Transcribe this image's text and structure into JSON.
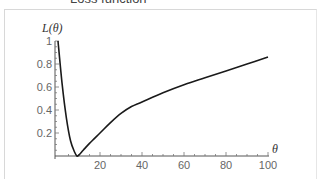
{
  "chart_data": {
    "type": "line",
    "title": "Loss function",
    "xlabel": "θ",
    "ylabel": "L(θ)",
    "xlim": [
      0,
      100
    ],
    "ylim": [
      0,
      1
    ],
    "x_ticks": [
      20,
      40,
      60,
      80,
      100
    ],
    "y_ticks": [
      0.2,
      0.4,
      0.6,
      0.8,
      1
    ],
    "grid": false,
    "legend": null,
    "series": [
      {
        "name": "L(θ)",
        "color": "#1a1a1a",
        "x": [
          0,
          2,
          4,
          6,
          8,
          9,
          10,
          12,
          15,
          20,
          25,
          30,
          35,
          40,
          50,
          60,
          70,
          80,
          90,
          100
        ],
        "y": [
          1.0,
          0.62,
          0.33,
          0.13,
          0.03,
          0.0,
          0.01,
          0.05,
          0.11,
          0.2,
          0.29,
          0.37,
          0.43,
          0.47,
          0.55,
          0.62,
          0.68,
          0.74,
          0.8,
          0.86
        ]
      }
    ]
  },
  "labels": {
    "title": "Loss function",
    "ylabel": "L(θ)",
    "xlabel": "θ",
    "x_ticks": [
      "20",
      "40",
      "60",
      "80",
      "100"
    ],
    "y_ticks": [
      "0.2",
      "0.4",
      "0.6",
      "0.8",
      "1"
    ]
  }
}
